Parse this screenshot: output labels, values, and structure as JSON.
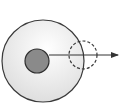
{
  "diagram": {
    "outer_circle": {
      "cx": 43,
      "cy": 61,
      "r": 41,
      "fill_center": "#ffffff",
      "fill_edge": "#dcdcdc",
      "stroke": "#3a3a3a"
    },
    "inner_circle": {
      "cx": 37,
      "cy": 61,
      "r": 12,
      "fill": "#8a8a8a",
      "stroke": "#2e2e2e"
    },
    "dashed_circle": {
      "cx": 83,
      "cy": 55,
      "r": 14,
      "stroke": "#3a3a3a"
    },
    "arrow": {
      "x1": 49,
      "y1": 55,
      "x2": 118,
      "y2": 55,
      "color": "#333333"
    }
  }
}
